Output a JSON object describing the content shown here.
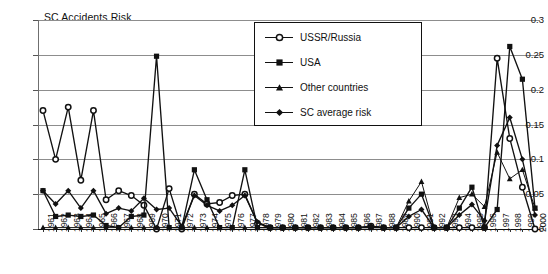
{
  "chart_data": {
    "type": "line",
    "title": "SC Accidents Risk",
    "xlabel": "",
    "ylabel": "",
    "ylim": [
      0,
      0.3
    ],
    "yticks": [
      0,
      0.05,
      0.1,
      0.15,
      0.2,
      0.25,
      0.3
    ],
    "ytick_labels": [
      "0",
      "0.05",
      "0.1",
      "0.15",
      "0.2",
      "0.25",
      "0.3"
    ],
    "grid": true,
    "legend_position": "top-center",
    "categories": [
      "1961",
      "1962",
      "1963",
      "1964",
      "1965",
      "1966",
      "1967",
      "1968",
      "1969",
      "1970",
      "1971",
      "1972",
      "1973",
      "1974",
      "1975",
      "1976",
      "1977",
      "1978",
      "1979",
      "1980",
      "1981",
      "1982",
      "1983",
      "1984",
      "1985",
      "1986",
      "1987",
      "1988",
      "1989",
      "1990",
      "1991",
      "1992",
      "1993",
      "1994",
      "1995",
      "1996",
      "1997",
      "1998",
      "1999",
      "2000"
    ],
    "series": [
      {
        "name": "USSR/Russia",
        "marker": "open-circle",
        "color": "#111111",
        "values": [
          0.17,
          0.1,
          0.175,
          0.07,
          0.17,
          0.042,
          0.055,
          0.048,
          0.034,
          0.0,
          0.058,
          0.0,
          0.05,
          0.036,
          0.038,
          0.048,
          0.05,
          0.008,
          0.002,
          0.002,
          0.002,
          0.002,
          0.002,
          0.002,
          0.002,
          0.002,
          0.004,
          0.002,
          0.002,
          0.002,
          0.002,
          0.002,
          0.002,
          0.002,
          0.002,
          0.002,
          0.245,
          0.13,
          0.06,
          0.0
        ]
      },
      {
        "name": "USA",
        "marker": "filled-square",
        "color": "#111111",
        "values": [
          0.055,
          0.018,
          0.02,
          0.018,
          0.02,
          0.005,
          0.002,
          0.018,
          0.02,
          0.248,
          0.002,
          0.002,
          0.085,
          0.042,
          0.002,
          0.002,
          0.085,
          0.002,
          0.002,
          0.002,
          0.002,
          0.002,
          0.002,
          0.002,
          0.002,
          0.002,
          0.002,
          0.002,
          0.002,
          0.03,
          0.05,
          0.002,
          0.002,
          0.03,
          0.06,
          0.002,
          0.028,
          0.262,
          0.215,
          0.03
        ]
      },
      {
        "name": "Other countries",
        "marker": "filled-triangle",
        "color": "#111111",
        "values": [
          0.002,
          0.002,
          0.002,
          0.002,
          0.002,
          0.002,
          0.002,
          0.002,
          0.002,
          0.002,
          0.002,
          0.002,
          0.002,
          0.002,
          0.002,
          0.002,
          0.002,
          0.002,
          0.002,
          0.002,
          0.002,
          0.002,
          0.002,
          0.002,
          0.002,
          0.002,
          0.002,
          0.002,
          0.002,
          0.04,
          0.068,
          0.002,
          0.002,
          0.045,
          0.05,
          0.032,
          0.11,
          0.072,
          0.085,
          0.03
        ]
      },
      {
        "name": "SC average risk",
        "marker": "filled-diamond",
        "color": "#111111",
        "values": [
          0.055,
          0.036,
          0.055,
          0.03,
          0.055,
          0.022,
          0.03,
          0.026,
          0.044,
          0.028,
          0.03,
          0.004,
          0.048,
          0.034,
          0.026,
          0.034,
          0.048,
          0.01,
          0.002,
          0.002,
          0.002,
          0.002,
          0.002,
          0.002,
          0.002,
          0.002,
          0.004,
          0.002,
          0.002,
          0.018,
          0.028,
          0.002,
          0.002,
          0.02,
          0.035,
          0.012,
          0.12,
          0.16,
          0.1,
          0.02
        ]
      }
    ],
    "annotations": []
  },
  "legend": {
    "items": [
      {
        "label": "USSR/Russia",
        "marker": "open-circle"
      },
      {
        "label": "USA",
        "marker": "filled-square"
      },
      {
        "label": "Other countries",
        "marker": "filled-triangle"
      },
      {
        "label": "SC average risk",
        "marker": "filled-diamond"
      }
    ]
  },
  "caption": {
    "text": ""
  }
}
